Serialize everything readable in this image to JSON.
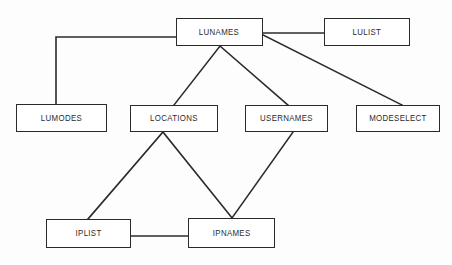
{
  "diagram": {
    "type": "entity-relationship-graph",
    "background_color": "#fdfdfd",
    "line_color": "#2b2b2b",
    "text_color": "#2b2b2b",
    "box_fill_color": "#ffffff",
    "nodes": [
      {
        "id": "lunames",
        "label": "LUNAMES",
        "x": 176,
        "y": 18,
        "w": 87,
        "h": 28
      },
      {
        "id": "lulist",
        "label": "LULIST",
        "x": 324,
        "y": 18,
        "w": 86,
        "h": 28
      },
      {
        "id": "lumodes",
        "label": "LUMODES",
        "x": 16,
        "y": 104,
        "w": 91,
        "h": 28
      },
      {
        "id": "locations",
        "label": "LOCATIONS",
        "x": 130,
        "y": 105,
        "w": 88,
        "h": 27
      },
      {
        "id": "usernames",
        "label": "USERNAMES",
        "x": 245,
        "y": 105,
        "w": 83,
        "h": 27
      },
      {
        "id": "modeselect",
        "label": "MODESELECT",
        "x": 356,
        "y": 105,
        "w": 84,
        "h": 27
      },
      {
        "id": "iplist",
        "label": "IPLIST",
        "x": 46,
        "y": 219,
        "w": 85,
        "h": 29
      },
      {
        "id": "ipnames",
        "label": "IPNAMES",
        "x": 188,
        "y": 218,
        "w": 87,
        "h": 30
      }
    ],
    "edges": [
      {
        "id": "lunames-lumodes",
        "from": "lunames",
        "to": "lumodes",
        "style": "orthogonal",
        "points": "176,37 56,37 56,104"
      },
      {
        "id": "lunames-lulist",
        "from": "lunames",
        "to": "lulist",
        "style": "straight",
        "points": "263,33 324,33"
      },
      {
        "id": "lunames-locations",
        "from": "lunames",
        "to": "locations",
        "style": "straight",
        "points": "220,46 174,105"
      },
      {
        "id": "lunames-usernames",
        "from": "lunames",
        "to": "usernames",
        "style": "straight",
        "points": "220,46 288,105"
      },
      {
        "id": "lunames-modeselect",
        "from": "lunames",
        "to": "modeselect",
        "style": "straight",
        "points": "263,35 402,105"
      },
      {
        "id": "locations-iplist",
        "from": "locations",
        "to": "iplist",
        "style": "straight",
        "points": "163,132 88,219"
      },
      {
        "id": "locations-ipnames",
        "from": "locations",
        "to": "ipnames",
        "style": "straight",
        "points": "163,132 232,218"
      },
      {
        "id": "usernames-ipnames",
        "from": "usernames",
        "to": "ipnames",
        "style": "straight",
        "points": "293,132 232,218"
      },
      {
        "id": "iplist-ipnames",
        "from": "iplist",
        "to": "ipnames",
        "style": "straight",
        "points": "131,236 188,236"
      }
    ]
  }
}
